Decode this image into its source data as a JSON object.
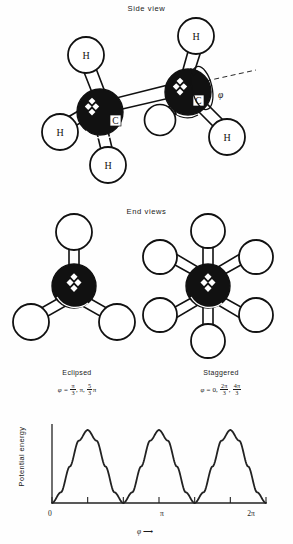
{
  "figure": {
    "side_view_title": "Side view",
    "end_views_title": "End views"
  },
  "side_view": {
    "carbon_label": "C",
    "hydrogen_label": "H",
    "rotation_angle_symbol": "φ",
    "carbons": [
      {
        "name": "carbon-left",
        "cx": 100,
        "cy": 112,
        "r": 23
      },
      {
        "name": "carbon-right",
        "cx": 188,
        "cy": 92,
        "r": 23
      }
    ],
    "hydrogens": [
      {
        "name": "hydrogen-left-top",
        "cx": 86,
        "cy": 55,
        "r": 18
      },
      {
        "name": "hydrogen-left-lower",
        "cx": 60,
        "cy": 132,
        "r": 18
      },
      {
        "name": "hydrogen-left-bottom",
        "cx": 108,
        "cy": 165,
        "r": 18
      },
      {
        "name": "hydrogen-right-top",
        "cx": 196,
        "cy": 36,
        "r": 18
      },
      {
        "name": "hydrogen-right-lower",
        "cx": 227,
        "cy": 137,
        "r": 18
      },
      {
        "name": "hydrogen-right-back",
        "cx": 160,
        "cy": 120,
        "r": 16
      }
    ]
  },
  "end_views": {
    "eclipsed": {
      "label": "Eclipsed",
      "formula_prefix": "φ =",
      "values": [
        "π/3",
        "π",
        "5π/3"
      ],
      "bond_angles_deg": [
        90,
        210,
        330
      ],
      "center": {
        "cx": 74,
        "cy": 286,
        "r": 22
      },
      "bond_length": 45,
      "hydrogen_radius": 18
    },
    "staggered": {
      "label": "Staggered",
      "formula_prefix": "φ =",
      "values": [
        "0",
        "2π/3",
        "4π/3"
      ],
      "bond_angles_deg": [
        0,
        60,
        120,
        180,
        240,
        300
      ],
      "center": {
        "cx": 208,
        "cy": 286,
        "r": 22
      },
      "bond_length": 45,
      "hydrogen_radius": 17
    }
  },
  "chart_data": {
    "type": "line",
    "title": "",
    "xlabel": "φ",
    "ylabel": "Potential energy",
    "xlim": [
      0,
      6.2831853
    ],
    "ylim": [
      0,
      1
    ],
    "grid": false,
    "legend": null,
    "x_tick_values": [
      0,
      1.0471976,
      2.0943951,
      3.1415927,
      4.1887902,
      5.2359878,
      6.2831853
    ],
    "x_tick_labels": [
      "0",
      "",
      "",
      "π",
      "",
      "",
      "2π"
    ],
    "y_ticks_shown": false,
    "series": [
      {
        "name": "Potential energy V(φ)",
        "formula": "V = 0.5 * (1 - cos(3φ))",
        "maxima_at": [
          1.0471976,
          3.1415927,
          5.2359878
        ],
        "minima_at": [
          0,
          2.0943951,
          4.1887902,
          6.2831853
        ],
        "x": [
          0,
          0.2617994,
          0.5235988,
          0.7853982,
          1.0471976,
          1.308997,
          1.5707963,
          1.8325957,
          2.0943951,
          2.3561945,
          2.6179939,
          2.8797933,
          3.1415927,
          3.4033921,
          3.6651914,
          3.9269908,
          4.1887902,
          4.4505896,
          4.712389,
          4.9741884,
          5.2359878,
          5.4977871,
          5.7595865,
          6.0213859,
          6.2831853
        ],
        "y": [
          0,
          0.1464,
          0.5,
          0.8536,
          1.0,
          0.8536,
          0.5,
          0.1464,
          0,
          0.1464,
          0.5,
          0.8536,
          1.0,
          0.8536,
          0.5,
          0.1464,
          0,
          0.1464,
          0.5,
          0.8536,
          1.0,
          0.8536,
          0.5,
          0.1464,
          0
        ]
      }
    ]
  }
}
